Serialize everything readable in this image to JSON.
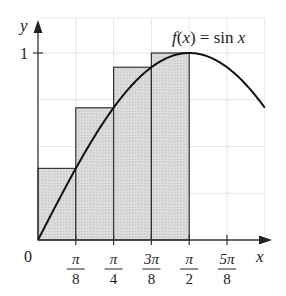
{
  "chart_data": {
    "type": "bar",
    "subtype": "riemann-sum-right-endpoints-with-curve",
    "title": "",
    "function_label": "f(x) = sin x",
    "xlabel": "x",
    "ylabel": "y",
    "origin_label": "0",
    "y_ticks": [
      {
        "value": 1,
        "label": "1"
      }
    ],
    "x_ticks": [
      {
        "value": 0.3927,
        "num": "π",
        "den": "8"
      },
      {
        "value": 0.7854,
        "num": "π",
        "den": "4"
      },
      {
        "value": 1.1781,
        "num": "3π",
        "den": "8"
      },
      {
        "value": 1.5708,
        "num": "π",
        "den": "2"
      },
      {
        "value": 1.9635,
        "num": "5π",
        "den": "8"
      }
    ],
    "xlim": [
      0,
      2.36
    ],
    "ylim": [
      0,
      1.17
    ],
    "grid": true,
    "rectangles": {
      "width": 0.3927,
      "x_left": [
        0,
        0.3927,
        0.7854,
        1.1781
      ],
      "heights": [
        0.383,
        0.707,
        0.924,
        1.0
      ],
      "fill": "#d9d9d9",
      "stroke": "#333333"
    },
    "curve": {
      "name": "sin x",
      "x_range": [
        0,
        2.356
      ],
      "stroke": "#111111"
    },
    "colors": {
      "grid": "#e6e6e6",
      "axis": "#333333",
      "rect_fill": "#d9d9d9"
    }
  }
}
